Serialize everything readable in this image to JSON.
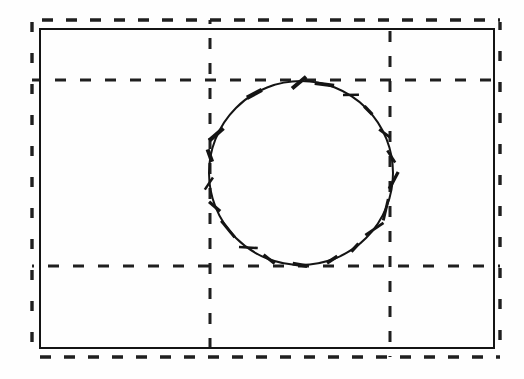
{
  "canvas": {
    "width": 524,
    "height": 379,
    "background_color": "#fefefe",
    "stroke_color": "#1a1a1a",
    "title": "Dashed grid with inscribed circle and perimeter tick marks"
  },
  "chart_data": {
    "type": "diagram",
    "title": "",
    "subtitle": "",
    "xlabel": "",
    "ylabel": "",
    "grid": true,
    "legend": "none",
    "xlim": [
      0,
      524
    ],
    "ylim": [
      0,
      379
    ],
    "solid_rectangle": {
      "x": 40,
      "y": 29,
      "width": 454,
      "height": 319,
      "stroke_width": 2.0,
      "style": "solid"
    },
    "dashed_frame": {
      "left_x": 32,
      "right_x": 500,
      "top_y": 20,
      "bottom_y": 357,
      "stroke_width": 3.4,
      "style": "dashed",
      "dash_length": 11,
      "dash_gap": 13
    },
    "grid_lines": {
      "vertical_x": [
        32,
        210,
        390,
        500
      ],
      "horizontal_y": [
        20,
        80,
        266,
        357
      ],
      "interior_vertical_x": [
        210,
        390
      ],
      "interior_horizontal_y": [
        80,
        266
      ],
      "stroke_width": 3.0,
      "dash_length": 11,
      "dash_gap": 14
    },
    "circle": {
      "center_x": 301,
      "center_y": 173,
      "radius": 92,
      "stroke_width": 2.0,
      "style": "solid",
      "tangent_top_y": 81,
      "tangent_bottom_y": 265,
      "left_x": 209,
      "right_x": 393
    },
    "tick_marks": {
      "count": 20,
      "description": "short segments crossing the circle perimeter at irregular hand-drawn angles",
      "mean_length": 16,
      "stroke_width": 3.2,
      "angles_deg": [
        90,
        74,
        58,
        42,
        26,
        10,
        354,
        338,
        322,
        306,
        290,
        270,
        250,
        234,
        218,
        202,
        186,
        170,
        154,
        122
      ]
    }
  },
  "elements": {
    "outer_boundary_label": "solid-rectangle-boundary",
    "grid_label": "dashed-grid",
    "circle_label": "inscribed-circle",
    "ticks_label": "circle-perimeter-ticks"
  }
}
